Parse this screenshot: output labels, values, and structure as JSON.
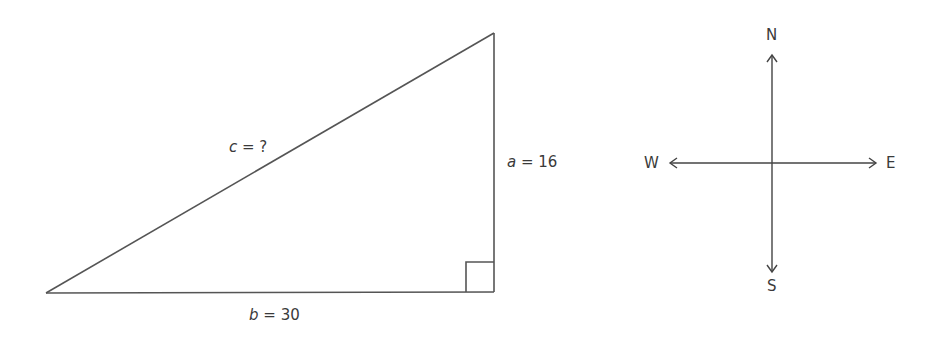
{
  "triangle": {
    "type": "right-triangle",
    "vertices": {
      "bottom_left": [
        46,
        293
      ],
      "bottom_right": [
        494,
        292
      ],
      "top": [
        494,
        33
      ]
    },
    "right_angle_at": "bottom_right",
    "stroke_color": "#555555",
    "labels": {
      "hypotenuse": {
        "var": "c",
        "rest": " = ?"
      },
      "vertical_leg": {
        "var": "a",
        "rest": " = 16"
      },
      "horizontal_leg": {
        "var": "b",
        "rest": " = 30"
      }
    },
    "values": {
      "a": 16,
      "b": 30,
      "c": "?"
    }
  },
  "compass": {
    "center": [
      772,
      163
    ],
    "labels": {
      "north": "N",
      "south": "S",
      "west": "W",
      "east": "E"
    },
    "stroke_color": "#444444"
  }
}
